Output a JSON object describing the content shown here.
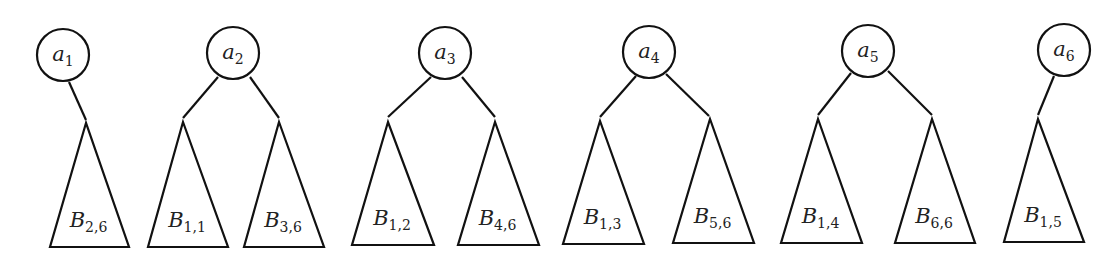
{
  "diagram": {
    "title": "",
    "colors": {
      "stroke": "#111111",
      "text": "#222222",
      "background": "#ffffff"
    },
    "trees": [
      {
        "root": {
          "letter": "a",
          "index": "1",
          "cx": 63,
          "cy": 55
        },
        "subtrees": [
          {
            "letter": "B",
            "index": "2,6",
            "apex": [
              86,
              123
            ],
            "base": [
              50,
              129,
              247
            ]
          }
        ],
        "edges": [
          [
            69,
            82,
            86,
            120
          ]
        ]
      },
      {
        "root": {
          "letter": "a",
          "index": "2",
          "cx": 233,
          "cy": 53
        },
        "subtrees": [
          {
            "letter": "B",
            "index": "1,1",
            "apex": [
              183,
              122
            ],
            "base": [
              148,
              228,
              247
            ]
          },
          {
            "letter": "B",
            "index": "3,6",
            "apex": [
              279,
              122
            ],
            "base": [
              244,
              324,
              247
            ]
          }
        ],
        "edges": [
          [
            218,
            77,
            183,
            118
          ],
          [
            250,
            77,
            279,
            118
          ]
        ]
      },
      {
        "root": {
          "letter": "a",
          "index": "3",
          "cx": 445,
          "cy": 53
        },
        "subtrees": [
          {
            "letter": "B",
            "index": "1,2",
            "apex": [
              388,
              122
            ],
            "base": [
              352,
              434,
              245
            ]
          },
          {
            "letter": "B",
            "index": "4,6",
            "apex": [
              495,
              122
            ],
            "base": [
              458,
              539,
              245
            ]
          }
        ],
        "edges": [
          [
            431,
            77,
            388,
            117
          ],
          [
            462,
            77,
            495,
            117
          ]
        ]
      },
      {
        "root": {
          "letter": "a",
          "index": "4",
          "cx": 649,
          "cy": 52
        },
        "subtrees": [
          {
            "letter": "B",
            "index": "1,3",
            "apex": [
              600,
              121
            ],
            "base": [
              563,
              644,
              244
            ]
          },
          {
            "letter": "B",
            "index": "5,6",
            "apex": [
              710,
              119
            ],
            "base": [
              673,
              754,
              243
            ]
          }
        ],
        "edges": [
          [
            636,
            76,
            600,
            117
          ],
          [
            666,
            74,
            709,
            116
          ]
        ]
      },
      {
        "root": {
          "letter": "a",
          "index": "5",
          "cx": 868,
          "cy": 51
        },
        "subtrees": [
          {
            "letter": "B",
            "index": "1,4",
            "apex": [
              818,
              119
            ],
            "base": [
              781,
              862,
              243
            ]
          },
          {
            "letter": "B",
            "index": "6,6",
            "apex": [
              932,
              119
            ],
            "base": [
              895,
              975,
              243
            ]
          }
        ],
        "edges": [
          [
            851,
            73,
            818,
            115
          ],
          [
            888,
            71,
            932,
            115
          ]
        ]
      },
      {
        "root": {
          "letter": "a",
          "index": "6",
          "cx": 1064,
          "cy": 50
        },
        "subtrees": [
          {
            "letter": "B",
            "index": "1,5",
            "apex": [
              1038,
              119
            ],
            "base": [
              1004,
              1084,
              242
            ]
          }
        ],
        "edges": [
          [
            1054,
            76,
            1038,
            115
          ]
        ]
      }
    ],
    "node_radius": 26
  }
}
